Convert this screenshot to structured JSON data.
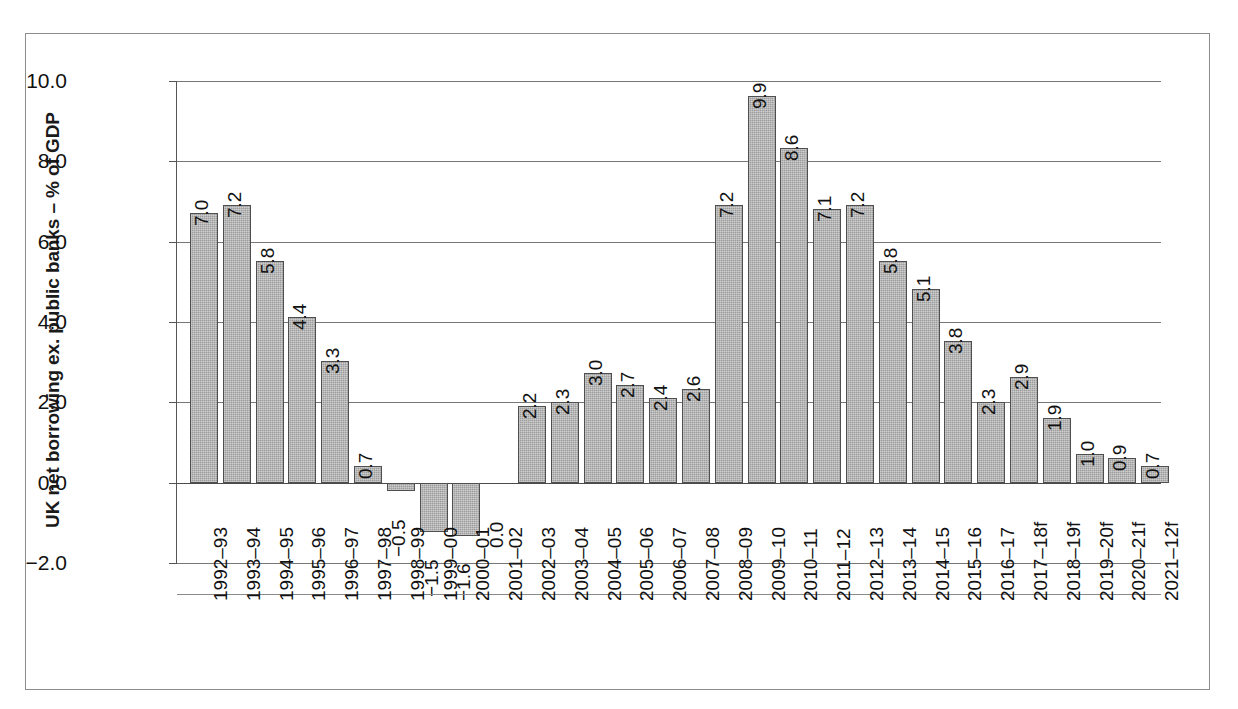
{
  "chart_data": {
    "type": "bar",
    "title": "",
    "subtitle": "",
    "xlabel": "",
    "ylabel": "UK net borrowing ex. public banks – % of GDP",
    "ylim": [
      -2.0,
      10.0
    ],
    "yticks": [
      "10.0",
      "8.0",
      "6.0",
      "4.0",
      "2.0",
      "0.0",
      "−2.0"
    ],
    "ytick_values": [
      10.0,
      8.0,
      6.0,
      4.0,
      2.0,
      0.0,
      -2.0
    ],
    "grid": true,
    "legend": "none",
    "bar_color": "#9c9c9c",
    "bar_edge_color": "#4f4f4f",
    "categories": [
      "1992–93",
      "1993–94",
      "1994–95",
      "1995–96",
      "1996–97",
      "1997–98",
      "1998–99",
      "1999–00",
      "2000–01",
      "2001–02",
      "2002–03",
      "2003–04",
      "2004–05",
      "2005–06",
      "2006–07",
      "2007–08",
      "2008–09",
      "2009–10",
      "2010–11",
      "2011–12",
      "2012–13",
      "2013–14",
      "2014–15",
      "2015–16",
      "2016–17",
      "2017–18f",
      "2018–19f",
      "2019–20f",
      "2020–21f",
      "2021–12f"
    ],
    "values": [
      7.0,
      7.2,
      5.8,
      4.4,
      3.3,
      0.7,
      -0.5,
      -1.5,
      -1.6,
      0.0,
      2.2,
      2.3,
      3.0,
      2.7,
      2.4,
      2.6,
      7.2,
      9.9,
      8.6,
      7.1,
      7.2,
      5.8,
      5.1,
      3.8,
      2.3,
      2.9,
      1.9,
      1.0,
      0.9,
      0.7
    ],
    "data_labels": [
      "7.0",
      "7.2",
      "5.8",
      "4.4",
      "3.3",
      "0.7",
      "−0.5",
      "−1.5",
      "−1.6",
      "0.0",
      "2.2",
      "2.3",
      "3.0",
      "2.7",
      "2.4",
      "2.6",
      "7.2",
      "9.9",
      "8.6",
      "7.1",
      "7.2",
      "5.8",
      "5.1",
      "3.8",
      "2.3",
      "2.9",
      "1.9",
      "1.0",
      "0.9",
      "0.7"
    ]
  }
}
